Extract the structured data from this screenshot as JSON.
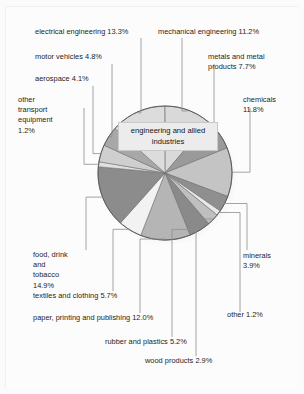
{
  "center_label": "engineering and\nallied industries",
  "chart_data": {
    "type": "pie",
    "title": "",
    "center_annotation": "engineering and allied industries",
    "units": "percent",
    "total": 100.0,
    "legend": "none",
    "grid": false,
    "categories": [
      "mechanical engineering",
      "metals and metal products",
      "chemicals",
      "minerals",
      "other",
      "wood products",
      "rubber and plastics",
      "paper, printing and publishing",
      "textiles and clothing",
      "food, drink and tobacco",
      "other transport equipment",
      "aerospace",
      "motor vehicles",
      "electrical engineering"
    ],
    "values": [
      11.2,
      7.7,
      11.8,
      3.9,
      1.2,
      2.9,
      5.2,
      12.0,
      5.7,
      14.9,
      1.2,
      4.1,
      4.8,
      13.3
    ],
    "slice_colors": [
      "#d9d9d9",
      "#9a9a9a",
      "#c4c4c4",
      "#8f8f8f",
      "#e8e8e8",
      "#bfbfbf",
      "#8a8a8a",
      "#b5b5b5",
      "#f2f2f2",
      "#8c8c8c",
      "#e0e0e0",
      "#cfcfcf",
      "#a8a8a8",
      "#dcdcdc"
    ]
  },
  "labels": [
    {
      "id": "electrical-engineering",
      "text": "electrical engineering 13.3%"
    },
    {
      "id": "motor-vehicles",
      "text": "motor vehicles 4.8%"
    },
    {
      "id": "aerospace",
      "text": "aerospace 4.1%"
    },
    {
      "id": "other-transport",
      "text": "other\ntransport\nequipment\n1.2%"
    },
    {
      "id": "mechanical-engineering",
      "text": "mechanical engineering 11.2%"
    },
    {
      "id": "metals",
      "text": "metals and metal\nproducts 7.7%"
    },
    {
      "id": "chemicals",
      "text": "chemicals\n11.8%"
    },
    {
      "id": "minerals",
      "text": "minerals\n3.9%"
    },
    {
      "id": "other",
      "text": "other 1.2%"
    },
    {
      "id": "wood-products",
      "text": "wood products 2.9%"
    },
    {
      "id": "rubber-plastics",
      "text": "rubber and plastics 5.2%"
    },
    {
      "id": "paper-printing",
      "text": "paper, printing and publishing 12.0%"
    },
    {
      "id": "textiles",
      "text": "textiles and clothing 5.7%"
    },
    {
      "id": "food-drink",
      "text": "food, drink\nand\ntobacco\n14.9%"
    }
  ]
}
